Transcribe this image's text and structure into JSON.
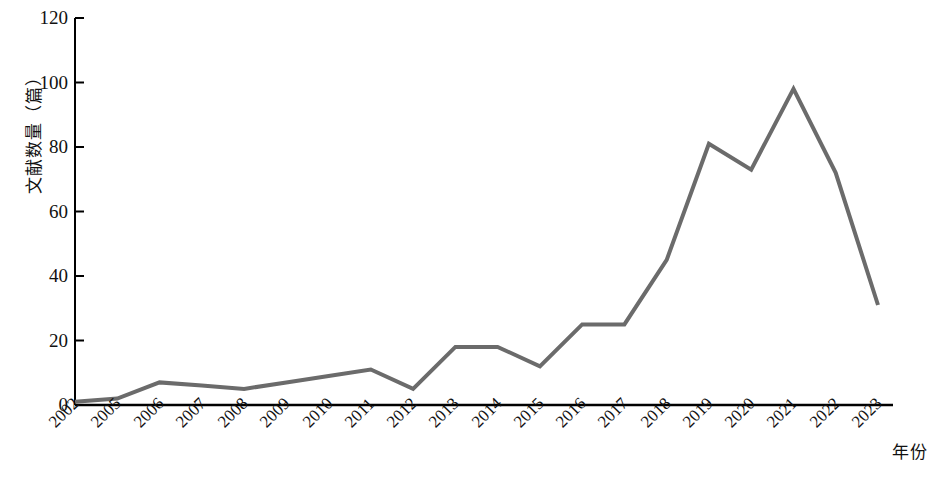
{
  "chart_data": {
    "type": "line",
    "title": "",
    "xlabel": "年份",
    "ylabel": "文献数量（篇）",
    "categories": [
      "2002",
      "2005",
      "2006",
      "2007",
      "2008",
      "2009",
      "2010",
      "2011",
      "2012",
      "2013",
      "2014",
      "2015",
      "2016",
      "2017",
      "2018",
      "2019",
      "2020",
      "2021",
      "2022",
      "2023"
    ],
    "values": [
      1,
      2,
      7,
      6,
      5,
      7,
      9,
      11,
      5,
      18,
      18,
      12,
      25,
      25,
      45,
      81,
      73,
      98,
      72,
      31
    ],
    "series": [
      {
        "name": "文献数量",
        "values": [
          1,
          2,
          7,
          6,
          5,
          7,
          9,
          11,
          5,
          18,
          18,
          12,
          25,
          25,
          45,
          81,
          73,
          98,
          72,
          31
        ]
      }
    ],
    "ylim": [
      0,
      120
    ],
    "ytick_values": [
      0,
      20,
      40,
      60,
      80,
      100,
      120
    ],
    "ytick_labels": [
      "0",
      "20",
      "40",
      "60",
      "80",
      "100",
      "120"
    ],
    "grid": false,
    "legend": false,
    "legend_position": "none",
    "line_color": "#6b6b6b",
    "line_width": 4,
    "axis_color": "#000000",
    "background_color": "#ffffff"
  },
  "axes": {
    "y_title": "文献数量（篇）",
    "x_title": "年份"
  },
  "caption": {
    "text": ""
  }
}
